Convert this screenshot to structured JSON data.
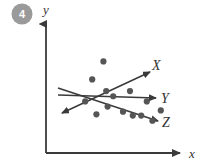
{
  "badge": {
    "label": "4",
    "color": "#9a9a9a",
    "text_color": "#ffffff"
  },
  "colors": {
    "axis": "#3a3a3a",
    "line": "#3a3a3a",
    "dot": "#555555",
    "background": "#ffffff",
    "label": "#333333"
  },
  "axes": {
    "x_label": "x",
    "y_label": "y"
  },
  "series_labels": {
    "x_line": "X",
    "y_line": "Y",
    "z_line": "Z"
  },
  "chart_data": {
    "type": "scatter",
    "title": "",
    "xlabel": "x",
    "ylabel": "y",
    "grid": false,
    "legend": "inline-right",
    "xlim": [
      0,
      100
    ],
    "ylim": [
      0,
      100
    ],
    "points": [
      {
        "x": 28,
        "y": 40
      },
      {
        "x": 33,
        "y": 57
      },
      {
        "x": 36,
        "y": 30
      },
      {
        "x": 41,
        "y": 71
      },
      {
        "x": 43,
        "y": 48
      },
      {
        "x": 44,
        "y": 36
      },
      {
        "x": 48,
        "y": 44
      },
      {
        "x": 55,
        "y": 32
      },
      {
        "x": 60,
        "y": 48
      },
      {
        "x": 62,
        "y": 29
      },
      {
        "x": 68,
        "y": 29
      },
      {
        "x": 72,
        "y": 40
      },
      {
        "x": 76,
        "y": 25
      },
      {
        "x": 82,
        "y": 33
      }
    ],
    "trendlines": [
      {
        "name": "X",
        "label": "X",
        "direction": "increasing",
        "x0": 11,
        "y0": 23,
        "x1": 79,
        "y1": 71
      },
      {
        "name": "Y",
        "label": "Y",
        "direction": "flat",
        "x0": 8,
        "y0": 46,
        "x1": 87,
        "y1": 42
      },
      {
        "name": "Z",
        "label": "Z",
        "direction": "decreasing",
        "x0": 8,
        "y0": 52,
        "x1": 88,
        "y1": 22
      }
    ]
  }
}
